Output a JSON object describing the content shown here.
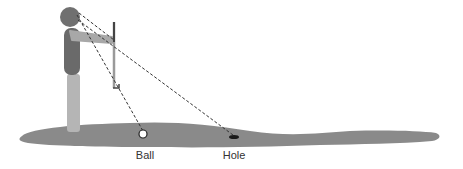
{
  "diagram": {
    "labels": {
      "ball": "Ball",
      "hole": "Hole"
    },
    "colors": {
      "green": "#8a8a8a",
      "head": "#707070",
      "torso": "#6a6a6a",
      "arm": "#a8a8a8",
      "legs": "#b5b5b5",
      "putter": "#555555",
      "sightline": "#333333",
      "ball_fill": "#ffffff",
      "hole": "#1a1a1a"
    }
  }
}
